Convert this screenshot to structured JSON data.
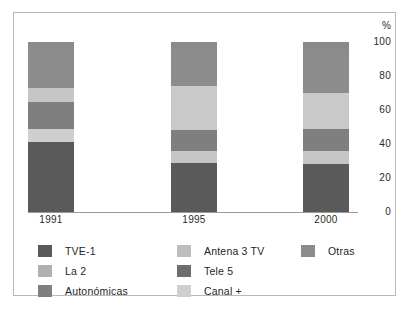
{
  "axis": {
    "unit_label": "%",
    "ticks": [
      "100",
      "80",
      "60",
      "40",
      "20",
      "0"
    ],
    "tick_values": [
      100,
      80,
      60,
      40,
      20,
      0
    ]
  },
  "categories": [
    "1991",
    "1995",
    "2000"
  ],
  "legend": {
    "columns": [
      [
        {
          "label": "TVE-1",
          "color": "#5a5a5a"
        },
        {
          "label": "La 2",
          "color": "#b0b0b0"
        },
        {
          "label": "Autonómicas",
          "color": "#7f7f7f"
        }
      ],
      [
        {
          "label": "Antena 3 TV",
          "color": "#bdbdbd"
        },
        {
          "label": "Tele 5",
          "color": "#6e6e6e"
        },
        {
          "label": "Canal +",
          "color": "#cfcfcf"
        }
      ],
      [
        {
          "label": "Otras",
          "color": "#8c8c8c"
        }
      ]
    ]
  },
  "chart_data": {
    "type": "bar",
    "stacked": true,
    "stack_total": 100,
    "title": "",
    "xlabel": "",
    "ylabel": "%",
    "ylim": [
      0,
      100
    ],
    "grid": false,
    "legend_position": "bottom",
    "categories": [
      "1991",
      "1995",
      "2000"
    ],
    "series": [
      {
        "name": "TVE-1",
        "color": "#5a5a5a",
        "values": [
          41,
          29,
          28
        ]
      },
      {
        "name": "Canal +",
        "color": "#cfcfcf",
        "values": [
          8,
          7,
          8
        ]
      },
      {
        "name": "Autonómicas",
        "color": "#7f7f7f",
        "values": [
          16,
          12,
          13
        ]
      },
      {
        "name": "Antena 3 TV",
        "color": "#bdbdbd",
        "values": [
          0,
          0,
          0
        ]
      },
      {
        "name": "Tele 5",
        "color": "#6e6e6e",
        "values": [
          0,
          0,
          0
        ]
      },
      {
        "name": "La 2",
        "color": "#b0b0b0",
        "values": [
          8,
          26,
          21
        ]
      },
      {
        "name": "Otras",
        "color": "#8c8c8c",
        "values": [
          27,
          23,
          26
        ]
      }
    ],
    "stack_order_bottom_to_top": [
      "TVE-1",
      "Canal +",
      "Autonómicas",
      "La 2",
      "Otras",
      "Antena 3 TV"
    ],
    "bars": [
      {
        "category": "1991",
        "segments": [
          {
            "name": "TVE-1",
            "value": 41,
            "color": "#5a5a5a"
          },
          {
            "name": "Canal +",
            "value": 8,
            "color": "#cfcfcf"
          },
          {
            "name": "Autonómicas",
            "value": 16,
            "color": "#7f7f7f"
          },
          {
            "name": "La 2",
            "value": 8,
            "color": "#c6c6c6"
          },
          {
            "name": "Otras",
            "value": 27,
            "color": "#8c8c8c"
          }
        ]
      },
      {
        "category": "1995",
        "segments": [
          {
            "name": "TVE-1",
            "value": 29,
            "color": "#5a5a5a"
          },
          {
            "name": "Canal +",
            "value": 7,
            "color": "#c6c6c6"
          },
          {
            "name": "Autonómicas",
            "value": 12,
            "color": "#7f7f7f"
          },
          {
            "name": "La 2",
            "value": 26,
            "color": "#c9c9c9"
          },
          {
            "name": "Otras",
            "value": 23,
            "color": "#8c8c8c"
          },
          {
            "name": "Antena 3 TV",
            "value": 3,
            "color": "#8a8a8a"
          }
        ]
      },
      {
        "category": "2000",
        "segments": [
          {
            "name": "TVE-1",
            "value": 28,
            "color": "#5a5a5a"
          },
          {
            "name": "Canal +",
            "value": 8,
            "color": "#c6c6c6"
          },
          {
            "name": "Autonómicas",
            "value": 13,
            "color": "#7f7f7f"
          },
          {
            "name": "La 2",
            "value": 21,
            "color": "#c9c9c9"
          },
          {
            "name": "Otras",
            "value": 26,
            "color": "#8c8c8c"
          },
          {
            "name": "Antena 3 TV",
            "value": 4,
            "color": "#8a8a8a"
          }
        ]
      }
    ]
  }
}
